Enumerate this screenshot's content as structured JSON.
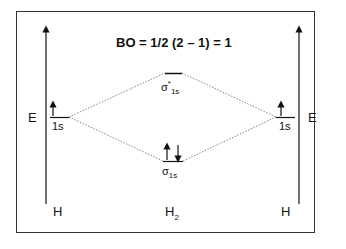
{
  "diagram": {
    "title": "BO = 1/2 (2 – 1) = 1",
    "energy_axis_left": "E",
    "energy_axis_right": "E",
    "left_atom": {
      "label": "H",
      "orbital": "1s",
      "electrons": "up"
    },
    "right_atom": {
      "label": "H",
      "orbital": "1s",
      "electrons": "up"
    },
    "molecule": {
      "label_main": "H",
      "label_sub": "2"
    },
    "antibonding": {
      "symbol": "σ",
      "sup": "*",
      "sub": "1s",
      "electrons": "none"
    },
    "bonding": {
      "symbol": "σ",
      "sub": "1s",
      "electrons": "up-down"
    },
    "colors": {
      "line": "#111111",
      "frame": "#333333",
      "dotted": "#666666"
    }
  }
}
